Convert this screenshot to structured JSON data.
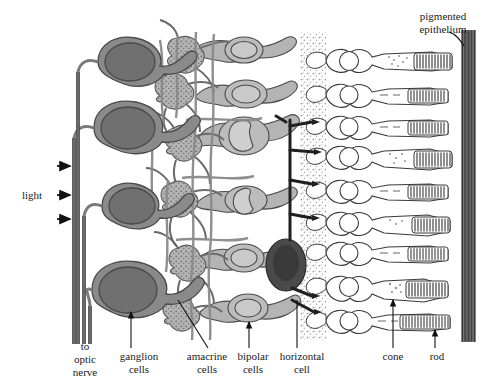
{
  "figure": {
    "background": "#ffffff"
  },
  "colors": {
    "ganglion_body": "#8a8a8a",
    "ganglion_nucleus": "#707070",
    "amacrine_body": "#a9a9a9",
    "bipolar_body": "#b4b4b4",
    "bipolar_nucleus": "#c9c9c9",
    "horizontal_body": "#4a4a4a",
    "photoreceptor_body": "#ffffff",
    "pigment_band": "#5a5a5a",
    "outline": "#3a3a3a",
    "stipple": "#9a9a9a",
    "text": "#1a1a1a"
  },
  "labels": {
    "light": "light",
    "optic_nerve_line1": "to",
    "optic_nerve_line2": "optic",
    "optic_nerve_line3": "nerve",
    "ganglion_line1": "ganglion",
    "ganglion_line2": "cells",
    "amacrine_line1": "amacrine",
    "amacrine_line2": "cells",
    "bipolar_line1": "bipolar",
    "bipolar_line2": "cells",
    "horizontal_line1": "horizontal",
    "horizontal_line2": "cell",
    "cone": "cone",
    "rod": "rod",
    "pigmented_line1": "pigmented",
    "pigmented_line2": "epithelium"
  },
  "light_arrows": {
    "count": 3,
    "direction": "right",
    "y_positions": [
      166,
      195,
      219
    ]
  },
  "cells": {
    "ganglion_cells": {
      "count": 4,
      "y_positions": [
        68,
        130,
        205,
        288
      ],
      "description": "large gray somas with darker round nuclei, axons run left into optic nerve fiber bundle"
    },
    "amacrine_cells": {
      "count": 5,
      "description": "stippled branching somas in inner plexiform layer"
    },
    "bipolar_cells": {
      "count": 5,
      "y_positions": [
        50,
        92,
        137,
        200,
        255
      ],
      "description": "light gray ellipsoid somas with horseshoe-shaped nuclei"
    },
    "horizontal_cell": {
      "count": 1,
      "y_position": 262,
      "description": "dark gray soma with bold lateral processes in outer plexiform layer"
    },
    "photoreceptors": {
      "count": 9,
      "y_positions": [
        60,
        92,
        122,
        152,
        186,
        218,
        248,
        282,
        318
      ],
      "description": "unfilled somas with round nuclei, inner segments, striated outer segments abutting pigmented epithelium"
    }
  },
  "optic_nerve_fibers": {
    "count": 4,
    "description": "parallel vertical axon lines descending at left"
  },
  "pigmented_epithelium": {
    "description": "vertical striated dark band at right edge"
  }
}
